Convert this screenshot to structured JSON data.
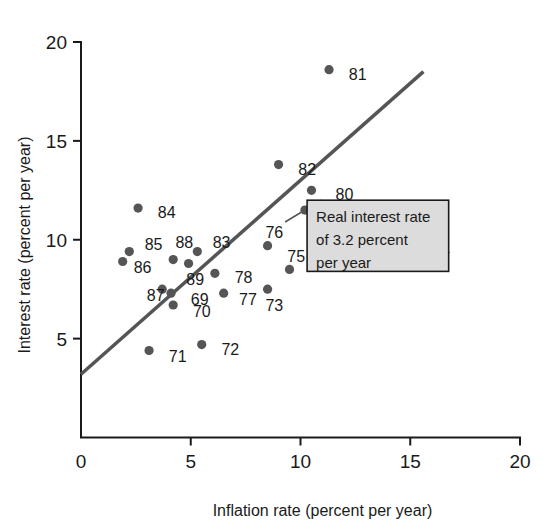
{
  "chart_data": {
    "type": "scatter",
    "title": "",
    "xlabel": "Inflation rate (percent per year)",
    "ylabel": "Interest rate (percent per year)",
    "xlim": [
      0,
      20
    ],
    "ylim": [
      0,
      20
    ],
    "xticks": [
      0,
      5,
      10,
      15,
      20
    ],
    "yticks": [
      5,
      10,
      15,
      20
    ],
    "xtick_labels": [
      "0",
      "5",
      "10",
      "15",
      "20"
    ],
    "ytick_labels": [
      "5",
      "10",
      "15",
      "20"
    ],
    "grid": false,
    "legend": "none",
    "point_color": "#555555",
    "line_color": "#555555",
    "points": [
      {
        "label": "69",
        "x": 4.1,
        "y": 7.3,
        "lx": 5.0,
        "ly": 7.0
      },
      {
        "label": "70",
        "x": 4.2,
        "y": 6.7,
        "lx": 5.1,
        "ly": 6.4
      },
      {
        "label": "71",
        "x": 3.1,
        "y": 4.4,
        "lx": 4.0,
        "ly": 4.1
      },
      {
        "label": "72",
        "x": 5.5,
        "y": 4.7,
        "lx": 6.4,
        "ly": 4.5
      },
      {
        "label": "73",
        "x": 8.5,
        "y": 7.5,
        "lx": 8.4,
        "ly": 6.7
      },
      {
        "label": "74",
        "x": 15.1,
        "y": 9.6,
        "lx": 16.0,
        "ly": 9.5
      },
      {
        "label": "75",
        "x": 9.5,
        "y": 8.5,
        "lx": 9.4,
        "ly": 9.2
      },
      {
        "label": "76",
        "x": 8.5,
        "y": 9.7,
        "lx": 8.4,
        "ly": 10.4
      },
      {
        "label": "77",
        "x": 6.5,
        "y": 7.3,
        "lx": 7.2,
        "ly": 7.0
      },
      {
        "label": "78",
        "x": 6.1,
        "y": 8.3,
        "lx": 7.0,
        "ly": 8.1
      },
      {
        "label": "79",
        "x": 10.2,
        "y": 11.5,
        "lx": 11.1,
        "ly": 11.2
      },
      {
        "label": "80",
        "x": 10.5,
        "y": 12.5,
        "lx": 11.6,
        "ly": 12.3
      },
      {
        "label": "81",
        "x": 11.3,
        "y": 18.6,
        "lx": 12.2,
        "ly": 18.4
      },
      {
        "label": "82",
        "x": 9.0,
        "y": 13.8,
        "lx": 9.9,
        "ly": 13.6
      },
      {
        "label": "83",
        "x": 5.3,
        "y": 9.4,
        "lx": 6.0,
        "ly": 9.9
      },
      {
        "label": "84",
        "x": 2.6,
        "y": 11.6,
        "lx": 3.5,
        "ly": 11.4
      },
      {
        "label": "85",
        "x": 2.2,
        "y": 9.4,
        "lx": 2.9,
        "ly": 9.8
      },
      {
        "label": "86",
        "x": 1.9,
        "y": 8.9,
        "lx": 2.4,
        "ly": 8.6
      },
      {
        "label": "87",
        "x": 3.7,
        "y": 7.5,
        "lx": 3.0,
        "ly": 7.2
      },
      {
        "label": "88",
        "x": 4.2,
        "y": 9.0,
        "lx": 4.3,
        "ly": 9.9
      },
      {
        "label": "89",
        "x": 4.9,
        "y": 8.8,
        "lx": 4.8,
        "ly": 8.0
      }
    ],
    "trend_line": {
      "x0": 0.0,
      "y0": 3.2,
      "x1": 15.6,
      "y1": 18.5
    },
    "annotation": {
      "lines": [
        "Real interest rate",
        "of 3.2 percent",
        "per year"
      ],
      "anchor_x": 9.3,
      "anchor_y": 10.9,
      "box_x": 10.3,
      "box_y": 8.4,
      "box_w": 6.45,
      "box_h": 3.6,
      "fill": "#dcdcdc",
      "border": "#1a1a1a"
    }
  }
}
